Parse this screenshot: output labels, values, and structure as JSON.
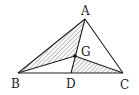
{
  "diagram": {
    "type": "geometry-triangle",
    "points": {
      "A": {
        "label": "A",
        "x": 85,
        "y": 19
      },
      "B": {
        "label": "B",
        "x": 18,
        "y": 73
      },
      "C": {
        "label": "C",
        "x": 123,
        "y": 73
      },
      "D": {
        "label": "D",
        "x": 71,
        "y": 73
      },
      "G": {
        "label": "G",
        "x": 75,
        "y": 56
      }
    },
    "segments": [
      "AB",
      "AC",
      "BC",
      "AD",
      "BG",
      "GC"
    ],
    "hatched_regions": [
      "ABG",
      "GDC"
    ],
    "colors": {
      "line": "#222222",
      "hatch": "#444444",
      "background": "#ffffff"
    }
  }
}
